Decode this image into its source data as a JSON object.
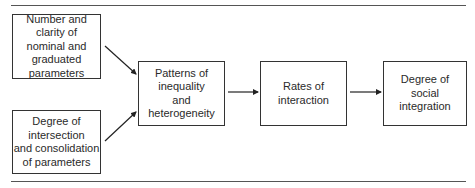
{
  "diagram": {
    "type": "flowchart",
    "nodes": [
      {
        "id": "number_clarity",
        "label": "Number and\nclarity of\nnominal and\ngraduated\nparameters"
      },
      {
        "id": "intersection",
        "label": "Degree of\nintersection\nand consolidation\nof parameters"
      },
      {
        "id": "patterns",
        "label": "Patterns of\ninequality\nand\nheterogeneity"
      },
      {
        "id": "rates",
        "label": "Rates of\ninteraction"
      },
      {
        "id": "integration",
        "label": "Degree of\nsocial\nintegration"
      }
    ],
    "edges": [
      {
        "from": "number_clarity",
        "to": "patterns"
      },
      {
        "from": "intersection",
        "to": "patterns"
      },
      {
        "from": "patterns",
        "to": "rates"
      },
      {
        "from": "rates",
        "to": "integration"
      }
    ]
  }
}
